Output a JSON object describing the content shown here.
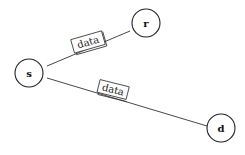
{
  "diagram": {
    "nodes": [
      {
        "id": "s",
        "label": "s"
      },
      {
        "id": "r",
        "label": "r"
      },
      {
        "id": "d",
        "label": "d"
      }
    ],
    "edges": [
      {
        "from": "s",
        "to": "r",
        "label": "data"
      },
      {
        "from": "s",
        "to": "d",
        "label": "data"
      }
    ]
  }
}
